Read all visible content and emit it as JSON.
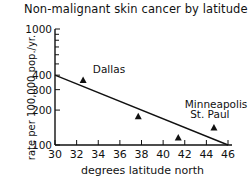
{
  "chart_data": {
    "type": "scatter",
    "title": "Non-malignant skin cancer by latitude",
    "xlabel": "degrees latitude north",
    "ylabel": "rate per 100,000 pop./yr.",
    "xlim": [
      30,
      46
    ],
    "ylim": [
      100,
      1000
    ],
    "yscale": "log",
    "x_ticks": [
      30,
      32,
      34,
      36,
      38,
      40,
      42,
      44,
      46
    ],
    "y_ticks": [
      100,
      200,
      300,
      400,
      1000
    ],
    "y_tick_labels": [
      "100",
      "200",
      "300",
      "400",
      "1000"
    ],
    "grid": false,
    "marker": "triangle",
    "points": [
      {
        "label": "Dallas",
        "x": 32.6,
        "y": 360
      },
      {
        "label": "",
        "x": 37.7,
        "y": 175
      },
      {
        "label": "",
        "x": 41.4,
        "y": 115
      },
      {
        "label": "Minneapolis St. Paul",
        "x": 44.7,
        "y": 140
      }
    ],
    "trend_line": {
      "x": [
        30,
        46
      ],
      "y": [
        400,
        100
      ]
    },
    "annotations": [
      {
        "text": "Dallas",
        "x": 33.5,
        "y": 420
      },
      {
        "text": "Minneapolis",
        "x": 42.0,
        "y": 210
      },
      {
        "text": "St. Paul",
        "x": 42.5,
        "y": 170
      }
    ]
  }
}
